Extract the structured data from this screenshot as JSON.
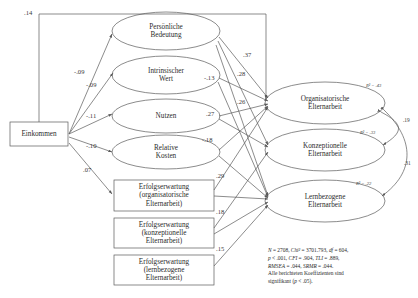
{
  "figure": {
    "type": "sem-path-diagram",
    "language": "de"
  },
  "nodes": {
    "predictor": {
      "id": "einkommen",
      "label": "Einkommen",
      "shape": "rectangle"
    },
    "mediators_oval": [
      {
        "id": "persoenliche_bedeutung",
        "label": "Persönliche\nBedeutung",
        "shape": "ellipse"
      },
      {
        "id": "intrinsischer_wert",
        "label": "Intrinsischer\nWert",
        "shape": "ellipse"
      },
      {
        "id": "nutzen",
        "label": "Nutzen",
        "shape": "ellipse"
      },
      {
        "id": "relative_kosten",
        "label": "Relative\nKosten",
        "shape": "ellipse"
      }
    ],
    "mediators_box": [
      {
        "id": "erw_org",
        "label": "Erfolgserwartung\n(organisatorische\nElternarbeit)",
        "shape": "rectangle"
      },
      {
        "id": "erw_konz",
        "label": "Erfolgserwartung\n(konzeptionelle\nElternarbeit)",
        "shape": "rectangle"
      },
      {
        "id": "erw_lern",
        "label": "Erfolgserwartung\n(lernbezogene\nElternarbeit)",
        "shape": "rectangle"
      }
    ],
    "outcomes": [
      {
        "id": "org_eltern",
        "label": "Organisatorische\nElternarbeit",
        "shape": "ellipse",
        "r2": "R² = .43"
      },
      {
        "id": "konz_eltern",
        "label": "Konzeptionelle\nElternarbeit",
        "shape": "ellipse",
        "r2": "R² = .33"
      },
      {
        "id": "lern_eltern",
        "label": "Lernbezogene\nElternarbeit",
        "shape": "ellipse",
        "r2": "R² = .22"
      }
    ]
  },
  "paths": {
    "from_predictor": [
      {
        "id": "ein-to-org-eltern",
        "label": ".14"
      },
      {
        "id": "ein-to-persoenliche",
        "label": "-.09"
      },
      {
        "id": "ein-to-intrinsisch",
        "label": "-.09"
      },
      {
        "id": "ein-to-nutzen",
        "label": "-.11"
      },
      {
        "id": "ein-to-kosten",
        "label": "-.10"
      },
      {
        "id": "ein-to-erw-org",
        "label": ".07"
      }
    ],
    "to_outcomes": [
      {
        "id": "persoenliche-to-outcome",
        "label": ".37"
      },
      {
        "id": "persoenliche-to-outcome-b",
        "label": ".28"
      },
      {
        "id": "persoenliche-to-outcome-c",
        "label": ".26"
      },
      {
        "id": "intrinsisch-to-outcome",
        "label": "-.13"
      },
      {
        "id": "nutzen-to-outcome",
        "label": ".27"
      },
      {
        "id": "kosten-to-outcome",
        "label": "-.18"
      },
      {
        "id": "erw-org-to-outcome",
        "label": ".29"
      },
      {
        "id": "erw-konz-to-outcome",
        "label": ".18"
      },
      {
        "id": "erw-lern-to-outcome",
        "label": ".15"
      }
    ],
    "correlations": [
      {
        "id": "corr-org-konz",
        "label": ".19"
      },
      {
        "id": "corr-org-lern",
        "label": ".31"
      }
    ]
  },
  "stats": {
    "line1_a": "N",
    "line1_b": " = 2708, ",
    "line1_c": "Chi²",
    "line1_d": " = 3701.793, ",
    "line1_e": "df",
    "line1_f": " = 604,",
    "line2_a": "p",
    "line2_b": " < .001, ",
    "line2_c": "CFI",
    "line2_d": " = .904, ",
    "line2_e": "TLI",
    "line2_f": " = .889,",
    "line3_a": "RMSEA",
    "line3_b": " = .044, ",
    "line3_c": "SRMR",
    "line3_d": " = .044.",
    "line4": "Alle berichteten Koeffizienten sind",
    "line5_a": "signifikant (",
    "line5_b": "p",
    "line5_c": " < .05)."
  },
  "style": {
    "stroke": "#5a5a5a",
    "text": "#2b2b2b"
  }
}
